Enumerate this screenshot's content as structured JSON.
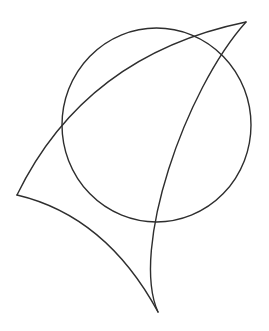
{
  "diagram": {
    "width": 269,
    "height": 331,
    "background": "#ffffff",
    "stroke_color": "#2e2e2e",
    "stroke_width": 1.4,
    "circle": {
      "cx": 156.5,
      "cy": 125,
      "rx": 94.5,
      "ry": 97
    },
    "curved_triangle": {
      "vertices": {
        "top_right": [
          246,
          22
        ],
        "left": [
          17,
          195
        ],
        "bottom": [
          158,
          312
        ]
      },
      "edges": {
        "top_edge": "M17,195 Q85,55 246,22",
        "right_edge": "M246,22 C185,90 130,250 158,312",
        "bottom_left_edge": "M17,195 Q106,216 158,312"
      }
    }
  }
}
